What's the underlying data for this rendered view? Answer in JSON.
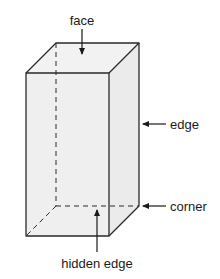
{
  "diagram": {
    "labels": {
      "face": "face",
      "edge": "edge",
      "corner": "corner",
      "hidden_edge": "hidden edge"
    },
    "colors": {
      "fill": "#efefef",
      "stroke": "#2a2a2a",
      "background": "#ffffff"
    }
  }
}
